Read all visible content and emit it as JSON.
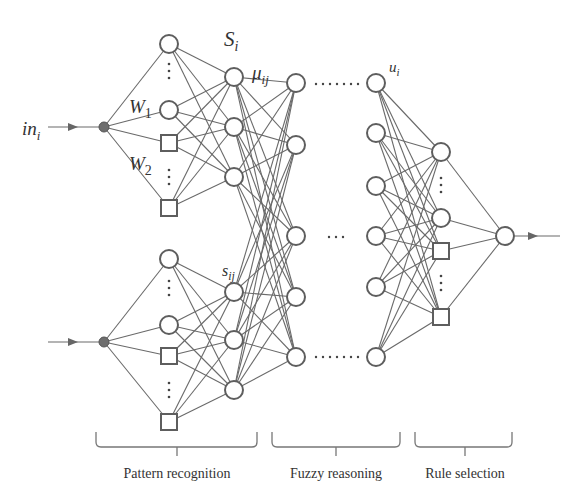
{
  "diagram": {
    "labels": {
      "input": "in",
      "input_sub": "i",
      "w1": "W",
      "w1_sub": "1",
      "w2": "W",
      "w2_sub": "2",
      "s_i": "S",
      "s_i_sub": "i",
      "mu_ij": "μ",
      "mu_ij_sub": "ij",
      "s_ij": "s",
      "s_ij_sub": "ij",
      "u_i": "u",
      "u_i_sub": "i"
    },
    "sections": [
      {
        "label": "Pattern recognition"
      },
      {
        "label": "Fuzzy reasoning"
      },
      {
        "label": "Rule selection"
      }
    ],
    "ellipsis_short": "⋯",
    "ellipsis_long": "·······"
  }
}
